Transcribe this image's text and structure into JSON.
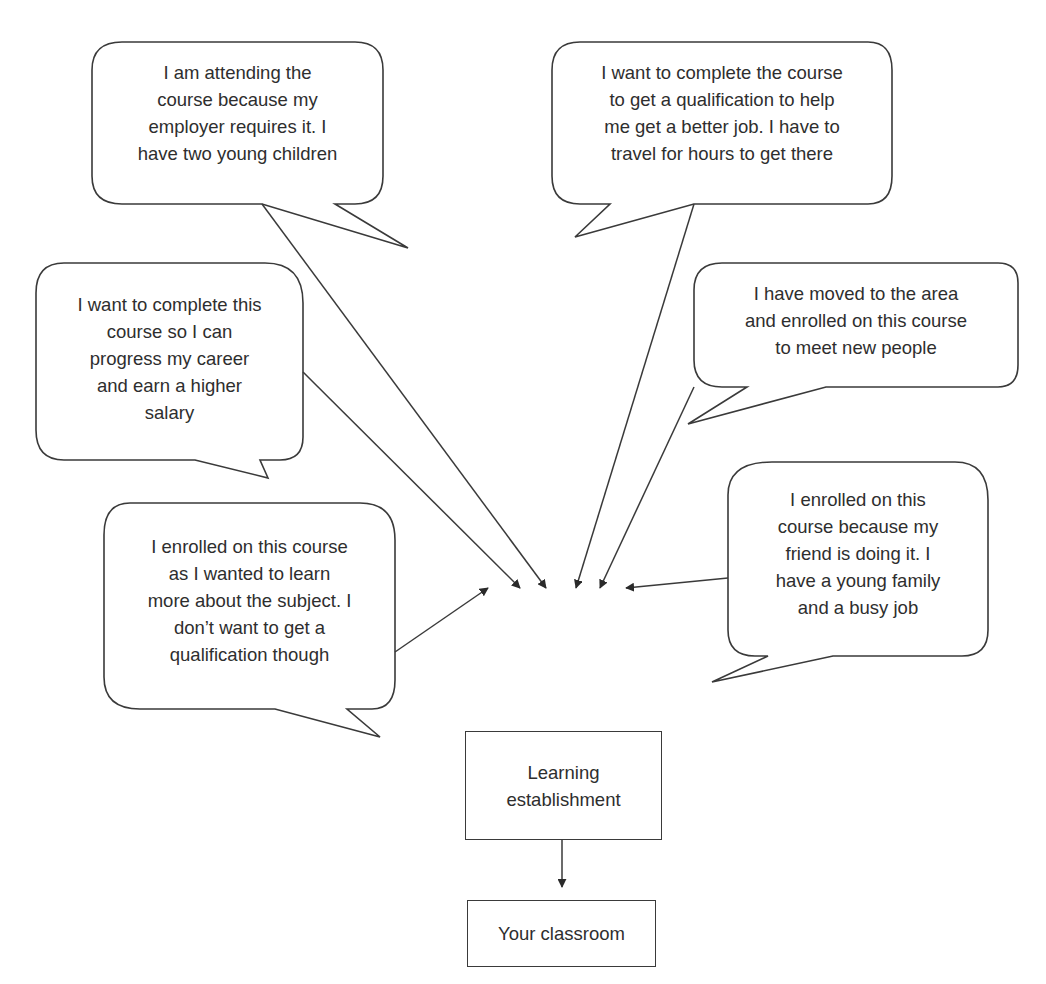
{
  "diagram": {
    "type": "flow",
    "bubbles": [
      {
        "id": "employer",
        "lines": [
          "I am attending the",
          "course because my",
          "employer requires it. I",
          "have two young children"
        ]
      },
      {
        "id": "qualification",
        "lines": [
          "I want to complete the course",
          "to get a qualification to help",
          "me get a better job. I have to",
          "travel for hours to get there"
        ]
      },
      {
        "id": "career",
        "lines": [
          "I want to complete this",
          "course so I can",
          "progress my career",
          "and earn a higher",
          "salary"
        ]
      },
      {
        "id": "new-area",
        "lines": [
          "I have moved to the area",
          "and enrolled on this course",
          "to meet new people"
        ]
      },
      {
        "id": "learn-subject",
        "lines": [
          "I enrolled on this course",
          "as I wanted to learn",
          "more about the subject. I",
          "don’t want to get a",
          "qualification though"
        ]
      },
      {
        "id": "friend",
        "lines": [
          "I enrolled on this",
          "course because my",
          "friend is doing it. I",
          "have a young family",
          "and a busy job"
        ]
      }
    ],
    "nodes": {
      "establishment": {
        "lines": [
          "Learning",
          "establishment"
        ]
      },
      "classroom": {
        "lines": [
          "Your classroom"
        ]
      }
    },
    "colors": {
      "stroke": "#3a3a3a",
      "text": "#2e2e2e",
      "background": "#ffffff"
    }
  }
}
